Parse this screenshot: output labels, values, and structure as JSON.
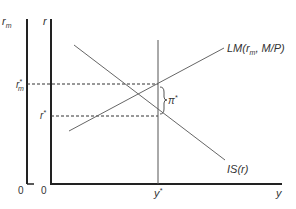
{
  "diagram": {
    "axes": {
      "left_axis_label": "r_m",
      "left_axis_label_base": "r",
      "left_axis_label_sub": "m",
      "main_axis_label": "r",
      "x_axis_label": "y",
      "origin_left": "0",
      "origin_main": "0"
    },
    "ticks": {
      "rm_star": {
        "base": "r",
        "sup": "*",
        "sub": "m"
      },
      "r_star": {
        "base": "r",
        "sup": "*"
      },
      "y_star": {
        "base": "y",
        "sup": "*"
      }
    },
    "curves": {
      "lm": {
        "label": "LM(r",
        "label_sub": "m",
        "label_rest": ", M/P)"
      },
      "is": {
        "label": "IS(r)"
      }
    },
    "annotation": {
      "base": "π",
      "sup": "*"
    },
    "colors": {
      "axis": "#222222",
      "curve": "#555555",
      "dash": "#333333"
    }
  }
}
